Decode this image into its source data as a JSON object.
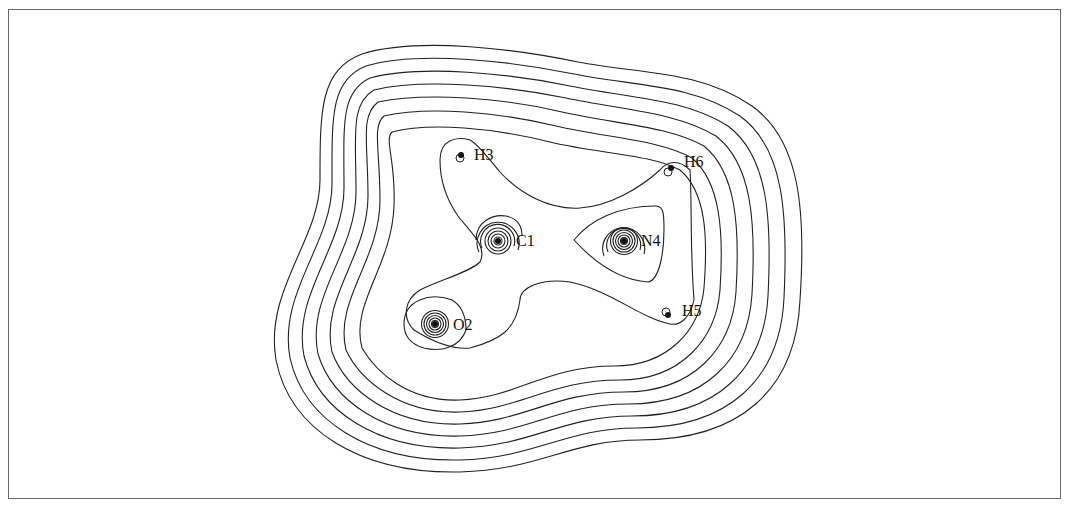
{
  "figure": {
    "type": "electron density contour map",
    "frame_color": "#6a6a6a",
    "line_color": "#222222",
    "background": "#ffffff"
  },
  "atoms": [
    {
      "id": "C1",
      "label": "C1",
      "x": 498,
      "y": 241,
      "core_rings": 6
    },
    {
      "id": "O2",
      "label": "O2",
      "x": 435,
      "y": 324,
      "core_rings": 7
    },
    {
      "id": "H3",
      "label": "H3",
      "x": 461,
      "y": 156,
      "core_rings": 0
    },
    {
      "id": "N4",
      "label": "N4",
      "x": 624,
      "y": 241,
      "core_rings": 7
    },
    {
      "id": "H5",
      "label": "H5",
      "x": 668,
      "y": 314,
      "core_rings": 0
    },
    {
      "id": "H6",
      "label": "H6",
      "x": 670,
      "y": 169,
      "core_rings": 0
    }
  ],
  "outer_contour_count": 8
}
